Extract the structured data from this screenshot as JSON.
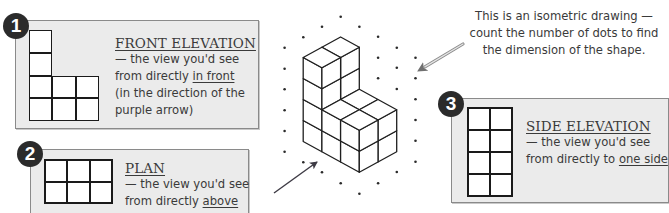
{
  "note": {
    "lines": [
      "This is an isometric drawing —",
      "count the number of dots to find",
      "the dimension of the shape."
    ]
  },
  "panels": [
    {
      "number": "1",
      "title": "FRONT ELEVATION",
      "desc_prefix": "— the view you'd see",
      "desc_line2_pre": "from directly ",
      "desc_line2_emph": "in front",
      "desc_line3": "(in the direction of the",
      "desc_line4": "purple arrow)",
      "grid": {
        "cols": 3,
        "rows": 4,
        "cells": [
          1,
          0,
          0,
          1,
          0,
          0,
          1,
          1,
          1,
          1,
          1,
          1
        ]
      }
    },
    {
      "number": "2",
      "title": "PLAN",
      "desc_prefix": "— the view you'd see",
      "desc_line2_pre": "from directly ",
      "desc_line2_emph": "above",
      "grid": {
        "cols": 3,
        "rows": 2,
        "cells": [
          1,
          1,
          1,
          1,
          1,
          1
        ]
      }
    },
    {
      "number": "3",
      "title": "SIDE ELEVATION",
      "desc_prefix": "— the view you'd see",
      "desc_line2_pre": "from directly to ",
      "desc_line2_emph": "one side",
      "grid": {
        "cols": 2,
        "rows": 4,
        "cells": [
          1,
          1,
          1,
          1,
          1,
          1,
          1,
          1
        ]
      }
    }
  ],
  "isometric": {
    "origin": [
      359.3,
      172.3
    ],
    "axis_left": [
      -18.7,
      -10.25
    ],
    "axis_right": [
      18.7,
      -10.3
    ],
    "axis_up": [
      0,
      -21
    ],
    "heights": [
      [
        2,
        2
      ],
      [
        2,
        2
      ],
      [
        4,
        4
      ]
    ],
    "front_arrow": {
      "from": [
        274,
        193
      ],
      "to": [
        317,
        162
      ],
      "color": "#3d3a44"
    },
    "note_arrow": {
      "from": [
        463,
        44
      ],
      "to": [
        418,
        71
      ],
      "color": "#8c8c8c"
    },
    "colors": {
      "line": "#1f1f1f",
      "dot": "#2a2a2a"
    }
  }
}
